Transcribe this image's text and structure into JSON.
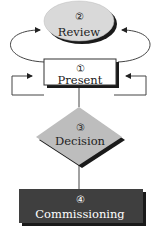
{
  "diagram": {
    "nodes": [
      {
        "id": "review",
        "number": "2",
        "label": "Review",
        "shape": "ellipse",
        "fill": "#d9d9d9",
        "text_color": "#222222"
      },
      {
        "id": "present",
        "number": "1",
        "label": "Present",
        "shape": "rectangle",
        "fill": "#ffffff",
        "text_color": "#222222"
      },
      {
        "id": "decision",
        "number": "3",
        "label": "Decision",
        "shape": "diamond",
        "fill": "#bdbdbd",
        "text_color": "#222222"
      },
      {
        "id": "commissioning",
        "number": "4",
        "label": "Commissioning",
        "shape": "rectangle",
        "fill": "#3f3f3f",
        "text_color": "#ffffff"
      }
    ],
    "edges": [
      {
        "from": "present",
        "to": "review",
        "side": "left",
        "arrow": true
      },
      {
        "from": "present",
        "to": "review",
        "side": "right",
        "arrow": true
      },
      {
        "from": "present",
        "to": "present",
        "side": "left",
        "loop": true
      },
      {
        "from": "present",
        "to": "present",
        "side": "right",
        "loop": true
      },
      {
        "from": "present",
        "to": "decision",
        "arrow": false
      },
      {
        "from": "decision",
        "to": "commissioning",
        "arrow": false
      }
    ],
    "colors": {
      "line": "#333333",
      "shadow": "#1a1a1a"
    }
  }
}
